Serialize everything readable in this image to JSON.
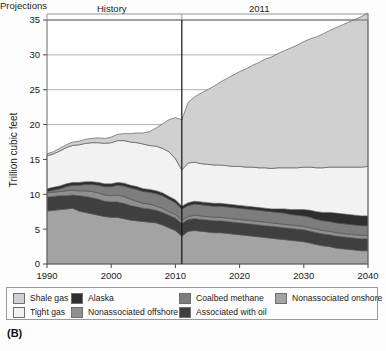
{
  "panel_tag": "(B)",
  "bands": {
    "history": "History",
    "divider_year": "2011",
    "projections": "Projections"
  },
  "legend": {
    "items": [
      {
        "label": "Shale gas",
        "color": "#d0d0d0",
        "row": 0,
        "col": 0
      },
      {
        "label": "Alaska",
        "color": "#2e2e2e",
        "row": 0,
        "col": 1
      },
      {
        "label": "Coalbed methane",
        "color": "#7d7d7d",
        "row": 0,
        "col": 2
      },
      {
        "label": "Nonassociated onshore",
        "color": "#a3a3a3",
        "row": 0,
        "col": 3
      },
      {
        "label": "Tight gas",
        "color": "#f2f2f2",
        "row": 1,
        "col": 0
      },
      {
        "label": "Nonassociated offshore",
        "color": "#8f8f8f",
        "row": 1,
        "col": 1
      },
      {
        "label": "Associated with oil",
        "color": "#3f3f3f",
        "row": 1,
        "col": 2
      }
    ]
  },
  "chart_data": {
    "type": "area",
    "title": "",
    "xlabel": "",
    "ylabel": "Trillion cubic feet",
    "xlim": [
      1990,
      2040
    ],
    "ylim": [
      0,
      35
    ],
    "xticks": [
      1990,
      2000,
      2010,
      2020,
      2030,
      2040
    ],
    "yticks": [
      0,
      5,
      10,
      15,
      20,
      25,
      30,
      35
    ],
    "grid": true,
    "legend_position": "below",
    "stacked": true,
    "annotations": [
      {
        "text": "History",
        "x": 2000
      },
      {
        "text": "2011",
        "x": 2011,
        "type": "vertical-divider"
      },
      {
        "text": "Projections",
        "x": 2027
      }
    ],
    "x": [
      1990,
      1991,
      1992,
      1993,
      1994,
      1995,
      1996,
      1997,
      1998,
      1999,
      2000,
      2001,
      2002,
      2003,
      2004,
      2005,
      2006,
      2007,
      2008,
      2009,
      2010,
      2011,
      2012,
      2013,
      2014,
      2015,
      2016,
      2017,
      2018,
      2019,
      2020,
      2021,
      2022,
      2023,
      2024,
      2025,
      2026,
      2027,
      2028,
      2029,
      2030,
      2031,
      2032,
      2033,
      2034,
      2035,
      2036,
      2037,
      2038,
      2039,
      2040
    ],
    "series": [
      {
        "name": "Nonassociated onshore",
        "color": "#a3a3a3",
        "values": [
          7.6,
          7.7,
          7.8,
          7.9,
          8.0,
          7.6,
          7.4,
          7.2,
          7.0,
          6.8,
          6.7,
          6.7,
          6.5,
          6.3,
          6.2,
          6.1,
          6.0,
          5.9,
          5.6,
          5.2,
          4.8,
          4.0,
          4.7,
          4.8,
          4.7,
          4.6,
          4.5,
          4.5,
          4.4,
          4.3,
          4.2,
          4.1,
          4.0,
          3.9,
          3.8,
          3.7,
          3.6,
          3.5,
          3.4,
          3.3,
          3.2,
          3.0,
          2.8,
          2.6,
          2.5,
          2.3,
          2.2,
          2.1,
          2.0,
          1.9,
          1.9
        ]
      },
      {
        "name": "Associated with oil",
        "color": "#3f3f3f",
        "values": [
          2.0,
          2.0,
          2.0,
          1.9,
          1.9,
          2.2,
          2.3,
          2.3,
          2.3,
          2.2,
          2.2,
          2.2,
          2.2,
          2.1,
          2.0,
          1.9,
          1.9,
          1.8,
          1.8,
          1.8,
          1.8,
          1.8,
          1.7,
          1.7,
          1.7,
          1.7,
          1.7,
          1.7,
          1.7,
          1.7,
          1.7,
          1.7,
          1.7,
          1.7,
          1.7,
          1.7,
          1.7,
          1.7,
          1.7,
          1.7,
          1.7,
          1.7,
          1.7,
          1.7,
          1.7,
          1.7,
          1.7,
          1.7,
          1.7,
          1.7,
          1.7
        ]
      },
      {
        "name": "Nonassociated offshore",
        "color": "#8f8f8f",
        "values": [
          0.6,
          0.6,
          0.6,
          0.7,
          0.7,
          0.7,
          0.8,
          0.9,
          0.9,
          0.9,
          0.9,
          1.0,
          1.0,
          0.9,
          0.8,
          0.7,
          0.7,
          0.6,
          0.6,
          0.5,
          0.5,
          0.5,
          0.4,
          0.5,
          0.5,
          0.5,
          0.5,
          0.5,
          0.5,
          0.5,
          0.5,
          0.5,
          0.5,
          0.5,
          0.5,
          0.5,
          0.5,
          0.5,
          0.5,
          0.5,
          0.5,
          0.5,
          0.5,
          0.5,
          0.5,
          0.5,
          0.5,
          0.5,
          0.5,
          0.5,
          0.5
        ]
      },
      {
        "name": "Coalbed methane",
        "color": "#7d7d7d",
        "values": [
          0.2,
          0.3,
          0.4,
          0.6,
          0.7,
          0.8,
          0.9,
          1.0,
          1.1,
          1.2,
          1.3,
          1.4,
          1.5,
          1.6,
          1.7,
          1.7,
          1.7,
          1.8,
          1.8,
          1.8,
          1.7,
          1.6,
          1.6,
          1.6,
          1.6,
          1.6,
          1.6,
          1.6,
          1.6,
          1.6,
          1.6,
          1.6,
          1.6,
          1.6,
          1.6,
          1.6,
          1.6,
          1.6,
          1.5,
          1.5,
          1.5,
          1.5,
          1.4,
          1.4,
          1.4,
          1.4,
          1.4,
          1.4,
          1.4,
          1.4,
          1.4
        ]
      },
      {
        "name": "Alaska",
        "color": "#2e2e2e",
        "values": [
          0.4,
          0.4,
          0.4,
          0.4,
          0.4,
          0.4,
          0.4,
          0.4,
          0.4,
          0.4,
          0.4,
          0.4,
          0.4,
          0.4,
          0.4,
          0.4,
          0.4,
          0.4,
          0.4,
          0.4,
          0.4,
          0.4,
          0.4,
          0.4,
          0.4,
          0.4,
          0.4,
          0.4,
          0.4,
          0.4,
          0.4,
          0.4,
          0.4,
          0.4,
          0.4,
          0.4,
          0.5,
          0.6,
          0.7,
          0.8,
          0.9,
          1.0,
          1.1,
          1.2,
          1.3,
          1.4,
          1.4,
          1.4,
          1.4,
          1.4,
          1.4
        ]
      },
      {
        "name": "Tight gas",
        "color": "#f2f2f2",
        "values": [
          4.7,
          4.8,
          5.0,
          5.2,
          5.3,
          5.4,
          5.5,
          5.6,
          5.7,
          5.8,
          5.9,
          6.0,
          6.1,
          6.2,
          6.3,
          6.4,
          6.3,
          6.4,
          6.4,
          6.4,
          5.9,
          5.2,
          5.7,
          5.6,
          5.5,
          5.5,
          5.5,
          5.5,
          5.5,
          5.5,
          5.6,
          5.6,
          5.7,
          5.7,
          5.8,
          5.8,
          5.9,
          5.9,
          6.0,
          6.0,
          6.1,
          6.2,
          6.3,
          6.4,
          6.5,
          6.6,
          6.7,
          6.8,
          6.9,
          7.0,
          7.1
        ]
      },
      {
        "name": "Shale gas",
        "color": "#d0d0d0",
        "values": [
          0.3,
          0.3,
          0.4,
          0.4,
          0.5,
          0.5,
          0.6,
          0.6,
          0.7,
          0.7,
          0.8,
          0.9,
          1.0,
          1.2,
          1.4,
          1.6,
          2.0,
          2.6,
          3.5,
          4.6,
          5.9,
          7.2,
          8.7,
          9.4,
          10.1,
          10.7,
          11.3,
          11.9,
          12.5,
          13.1,
          13.6,
          14.1,
          14.6,
          15.1,
          15.6,
          16.0,
          16.4,
          16.8,
          17.2,
          17.6,
          18.0,
          18.4,
          18.8,
          19.2,
          19.6,
          20.0,
          20.4,
          20.8,
          21.2,
          21.6,
          22.0
        ]
      }
    ]
  }
}
